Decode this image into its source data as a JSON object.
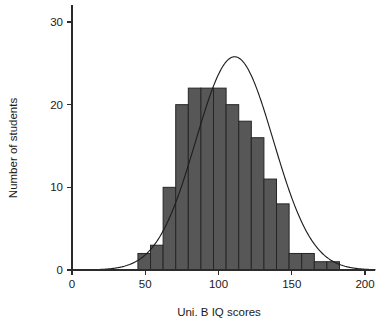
{
  "chart_data": {
    "type": "bar",
    "title": "",
    "subtitle": "",
    "xlabel": "Uni. B IQ scores",
    "ylabel": "Number of students",
    "xlim": [
      0,
      207
    ],
    "ylim": [
      0,
      32
    ],
    "xticks": [
      0,
      50,
      100,
      150,
      200
    ],
    "xtick_labels": [
      "0",
      "50",
      "100",
      "150",
      "200"
    ],
    "yticks": [
      0,
      10,
      20,
      30
    ],
    "ytick_labels": [
      "0",
      "10",
      "20",
      "30"
    ],
    "grid": false,
    "legend": null,
    "bin_width": 8.6,
    "bin_edges": [
      45.0,
      53.6,
      62.2,
      70.8,
      79.4,
      88.0,
      96.6,
      105.2,
      113.8,
      122.4,
      131.0,
      139.6,
      148.2,
      156.8,
      165.4,
      174.0,
      182.6
    ],
    "bin_centers": [
      49.3,
      57.9,
      66.5,
      75.1,
      83.7,
      92.3,
      100.9,
      109.5,
      118.1,
      126.7,
      135.3,
      143.9,
      152.5,
      161.1,
      169.7,
      178.3
    ],
    "values": [
      2,
      3,
      10,
      20,
      22,
      22,
      22,
      20,
      18,
      16,
      11,
      8,
      2,
      2,
      1,
      1
    ],
    "bar_color": "#575757",
    "bar_edge_color": "#262626",
    "overlay_curve": {
      "type": "normal-density",
      "mean": 111,
      "std": 26.5,
      "peak_value": 25.8,
      "color": "#1f1f1f"
    },
    "annotations": []
  },
  "axes": {
    "x_axis_name": "x-axis",
    "y_axis_name": "y-axis"
  }
}
